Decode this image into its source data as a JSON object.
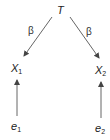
{
  "diagram": {
    "nodes": [
      {
        "id": "T",
        "label": "T",
        "sub": ""
      },
      {
        "id": "X1",
        "label": "X",
        "sub": "1"
      },
      {
        "id": "X2",
        "label": "X",
        "sub": "2"
      },
      {
        "id": "e1",
        "label": "e",
        "sub": "1"
      },
      {
        "id": "e2",
        "label": "e",
        "sub": "2"
      }
    ],
    "edges": [
      {
        "from": "T",
        "to": "X1",
        "label": "β"
      },
      {
        "from": "T",
        "to": "X2",
        "label": "β"
      },
      {
        "from": "e1",
        "to": "X1",
        "label": ""
      },
      {
        "from": "e2",
        "to": "X2",
        "label": ""
      }
    ],
    "edge_color": "#555555"
  }
}
